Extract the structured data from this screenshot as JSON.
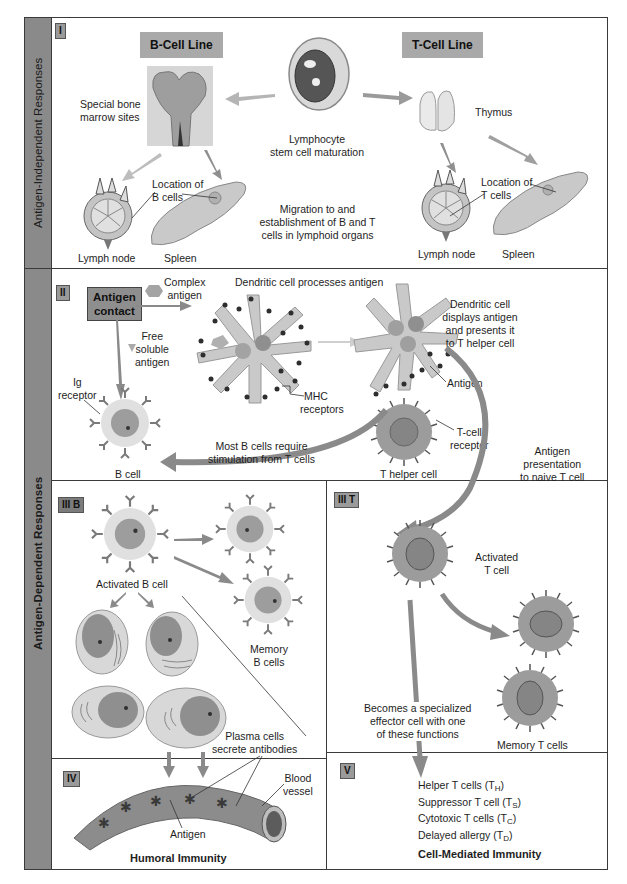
{
  "sidebar": {
    "top_label": "Antigen-Independent Responses",
    "bottom_label": "Antigen-Dependent Responses"
  },
  "section_1": {
    "badge": "I",
    "b_cell_line_title": "B-Cell Line",
    "t_cell_line_title": "T-Cell Line",
    "bone_marrow_label": [
      "Special bone",
      "marrow sites"
    ],
    "stem_cell_label": [
      "Lymphocyte",
      "stem cell maturation"
    ],
    "thymus_label": "Thymus",
    "location_b_cells_label": [
      "Location of",
      "B cells"
    ],
    "location_t_cells_label": [
      "Location of",
      "T cells"
    ],
    "migration_label": [
      "Migration to and",
      "establishment of B and T",
      "cells in lymphoid organs"
    ],
    "lymph_node_left_label": "Lymph node",
    "spleen_left_label": "Spleen",
    "lymph_node_right_label": "Lymph node",
    "spleen_right_label": "Spleen"
  },
  "section_2": {
    "badge": "II",
    "antigen_contact": [
      "Antigen",
      "contact"
    ],
    "complex_antigen_label": [
      "Complex",
      "antigen"
    ],
    "free_soluble_antigen_label": [
      "Free",
      "soluble",
      "antigen"
    ],
    "dendritic_processes_label": "Dendritic cell processes antigen",
    "dendritic_displays_label": [
      "Dendritic cell",
      "displays antigen",
      "and presents it",
      "to T helper cell"
    ],
    "mhc_label": [
      "MHC",
      "receptors"
    ],
    "antigen_label": "Antigen",
    "ig_receptor_label": [
      "Ig",
      "receptor"
    ],
    "b_cell_label": "B cell",
    "t_cell_receptor_label": [
      "T-cell",
      "receptor"
    ],
    "t_helper_label": "T helper cell",
    "b_cells_require_label": [
      "Most B cells require",
      "stimulation from T cells"
    ],
    "antigen_presentation_label": [
      "Antigen",
      "presentation",
      "to naive T cell"
    ]
  },
  "section_3b": {
    "badge": "III B",
    "activated_b_cell_label": "Activated B cell",
    "memory_b_cells_label": [
      "Memory",
      "B cells"
    ],
    "plasma_cells_label": [
      "Plasma cells",
      "secrete antibodies"
    ]
  },
  "section_3t": {
    "badge": "III T",
    "activated_t_cell_label": [
      "Activated",
      "T cell"
    ],
    "becomes_label": [
      "Becomes a specialized",
      "effector cell with one",
      "of these functions"
    ],
    "memory_t_cells_label": "Memory T cells"
  },
  "section_4": {
    "badge": "IV",
    "blood_vessel_label": [
      "Blood",
      "vessel"
    ],
    "antigen_label": "Antigen",
    "title": "Humoral Immunity"
  },
  "section_5": {
    "badge": "V",
    "functions": [
      {
        "name": "Helper T cells (T",
        "sub": "H",
        "close": ")"
      },
      {
        "name": "Suppressor T cell (T",
        "sub": "S",
        "close": ")"
      },
      {
        "name": "Cytotoxic T cells (T",
        "sub": "C",
        "close": ")"
      },
      {
        "name": "Delayed allergy (T",
        "sub": "D",
        "close": ")"
      }
    ],
    "title": "Cell-Mediated Immunity"
  },
  "colors": {
    "sidebar": "#8a8a8a",
    "badge": "#9a9a9a",
    "arrow": "#7a7a7a",
    "cell_fill": "#c8c8c8",
    "nucleus": "#8f8f8f",
    "t_cell": "#9c9c9c",
    "border": "#3a3a3a"
  }
}
